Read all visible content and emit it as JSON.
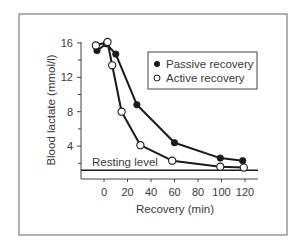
{
  "chart_data": {
    "type": "line",
    "title": "",
    "xlabel": "Recovery (min)",
    "ylabel": "Blood lactate (mmol/l)",
    "xlim": [
      -12,
      130
    ],
    "ylim": [
      0,
      16.5
    ],
    "xticks": [
      0,
      20,
      40,
      60,
      80,
      100,
      120
    ],
    "yticks": [
      4,
      8,
      12,
      16
    ],
    "yminor_ticks": [
      2,
      6,
      10,
      14
    ],
    "grid": false,
    "legend_position": "upper right",
    "series": [
      {
        "name": "Passive recovery",
        "marker": "filled-circle",
        "x": [
          -6,
          2,
          10,
          28,
          60,
          99,
          118
        ],
        "y": [
          15.1,
          15.9,
          14.7,
          8.8,
          4.4,
          2.6,
          2.3
        ]
      },
      {
        "name": "Active recovery",
        "marker": "open-circle",
        "x": [
          -7,
          3,
          7,
          15,
          31,
          58,
          99,
          119
        ],
        "y": [
          15.7,
          16.1,
          13.4,
          8.0,
          4.1,
          2.3,
          1.6,
          1.5
        ]
      }
    ],
    "annotations": [
      {
        "text": "Resting level",
        "type": "hline",
        "y": 1.2
      }
    ]
  },
  "legend": {
    "passive_label": "Passive recovery",
    "active_label": "Active recovery"
  },
  "axes": {
    "x_title": "Recovery (min)",
    "y_title": "Blood lactate (mmol/l)"
  },
  "annotation": {
    "resting_label": "Resting level"
  },
  "colors": {
    "line": "#1a1a1a",
    "frame": "#555555",
    "text": "#3a3a3a"
  }
}
